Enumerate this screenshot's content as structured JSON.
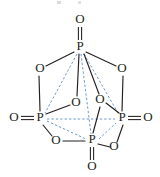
{
  "figure": {
    "background_color": "#ffffff",
    "bond_color": "#231f20",
    "dashed_bond_color": "#5b8fc9",
    "label_color": "#231f20"
  },
  "atoms": {
    "phosphorus": [
      {
        "id": "P-top",
        "label": "P",
        "x": 80,
        "y": 47,
        "role": "back-top-vertex"
      },
      {
        "id": "P-left",
        "label": "P",
        "x": 40,
        "y": 118,
        "role": "left-vertex"
      },
      {
        "id": "P-right",
        "label": "P",
        "x": 122,
        "y": 118,
        "role": "right-vertex"
      },
      {
        "id": "P-front",
        "label": "P",
        "x": 92,
        "y": 140,
        "role": "front-vertex"
      }
    ],
    "terminal_oxygen": [
      {
        "id": "O-top",
        "label": "O",
        "x": 80,
        "y": 20,
        "bonded_to": "P-top",
        "bond": "double"
      },
      {
        "id": "O-left",
        "label": "O",
        "x": 14,
        "y": 118,
        "bonded_to": "P-left",
        "bond": "double"
      },
      {
        "id": "O-right",
        "label": "O",
        "x": 148,
        "y": 118,
        "bonded_to": "P-right",
        "bond": "double"
      },
      {
        "id": "O-front",
        "label": "O",
        "x": 92,
        "y": 167,
        "bonded_to": "P-front",
        "bond": "double"
      }
    ],
    "bridging_oxygen": [
      {
        "id": "O-ul",
        "label": "O",
        "x": 40,
        "y": 69,
        "bridges": [
          "P-top",
          "P-left"
        ]
      },
      {
        "id": "O-ur",
        "label": "O",
        "x": 122,
        "y": 69,
        "bridges": [
          "P-top",
          "P-right"
        ]
      },
      {
        "id": "O-cl",
        "label": "O",
        "x": 76,
        "y": 103,
        "bridges": [
          "P-top",
          "P-front"
        ]
      },
      {
        "id": "O-cr",
        "label": "O",
        "x": 100,
        "y": 100,
        "bridges": [
          "P-top",
          "P-right"
        ]
      },
      {
        "id": "O-bl",
        "label": "O",
        "x": 56,
        "y": 141,
        "bridges": [
          "P-left",
          "P-front"
        ]
      },
      {
        "id": "O-br",
        "label": "O",
        "x": 114,
        "y": 147,
        "bridges": [
          "P-front",
          "P-right"
        ]
      }
    ]
  },
  "bonds": {
    "solid_single": [
      {
        "from": "P-top",
        "to": "O-ul"
      },
      {
        "from": "P-top",
        "to": "O-ur"
      },
      {
        "from": "P-top",
        "to": "O-cl"
      },
      {
        "from": "P-top",
        "to": "O-cr"
      },
      {
        "from": "O-ul",
        "to": "P-left"
      },
      {
        "from": "O-ur",
        "to": "P-right"
      },
      {
        "from": "P-left",
        "to": "O-bl"
      },
      {
        "from": "O-bl",
        "to": "P-front"
      },
      {
        "from": "P-front",
        "to": "O-br"
      },
      {
        "from": "O-br",
        "to": "P-right"
      },
      {
        "from": "P-left",
        "to": "O-cl"
      },
      {
        "from": "O-cr",
        "to": "P-right"
      },
      {
        "from": "O-cr",
        "to": "P-front"
      }
    ],
    "double": [
      {
        "from": "P-top",
        "to": "O-top"
      },
      {
        "from": "P-left",
        "to": "O-left"
      },
      {
        "from": "P-right",
        "to": "O-right"
      },
      {
        "from": "P-front",
        "to": "O-front"
      }
    ],
    "dashed_cage_edges": [
      {
        "from": "P-top",
        "to": "P-left"
      },
      {
        "from": "P-top",
        "to": "P-right"
      },
      {
        "from": "P-top",
        "to": "P-front"
      },
      {
        "from": "P-left",
        "to": "P-right"
      },
      {
        "from": "P-left",
        "to": "P-front"
      },
      {
        "from": "P-front",
        "to": "P-right"
      }
    ]
  }
}
